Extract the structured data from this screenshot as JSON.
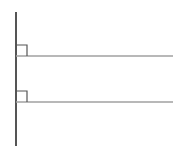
{
  "diagram": {
    "type": "geometry",
    "colors": {
      "background": "#ffffff",
      "vertical_line": "#555555",
      "horizontal_line": "#a0a0a0",
      "right_angle_marker": "#555555"
    },
    "vertical_line": {
      "x": 16,
      "y1": 12,
      "y2": 146
    },
    "horizontal_lines": [
      {
        "y": 56,
        "x1": 16,
        "x2": 173,
        "right_angle_marker": {
          "size": 11
        }
      },
      {
        "y": 102,
        "x1": 16,
        "x2": 173,
        "right_angle_marker": {
          "size": 11
        }
      }
    ]
  }
}
